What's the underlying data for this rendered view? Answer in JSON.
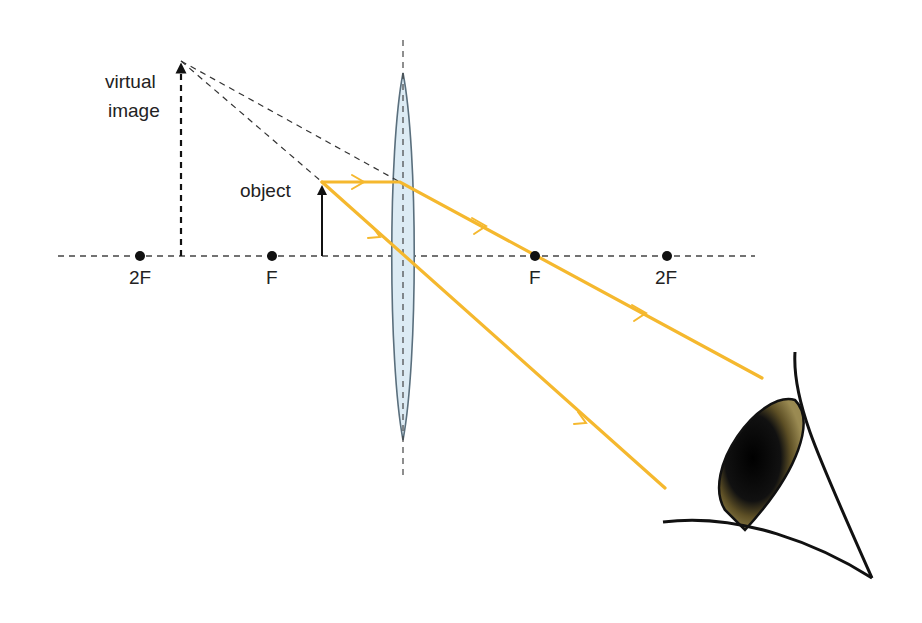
{
  "diagram": {
    "type": "converging-lens-magnifier-ray-diagram",
    "labels": {
      "virtual_image_line1": "virtual",
      "virtual_image_line2": "image",
      "object": "object",
      "left_2f": "2F",
      "left_f": "F",
      "right_f": "F",
      "right_2f": "2F"
    },
    "colors": {
      "ray": "#f5b82e",
      "axis": "#444444",
      "lens_fill": "#dbeaf3",
      "lens_stroke": "#5a6f7d",
      "iris": "#7a6a3a",
      "pupil": "#111111",
      "ink": "#111111"
    },
    "icons": {
      "eye": "eye-icon",
      "object_arrow": "up-arrow",
      "image_arrow": "dashed-up-arrow"
    }
  }
}
